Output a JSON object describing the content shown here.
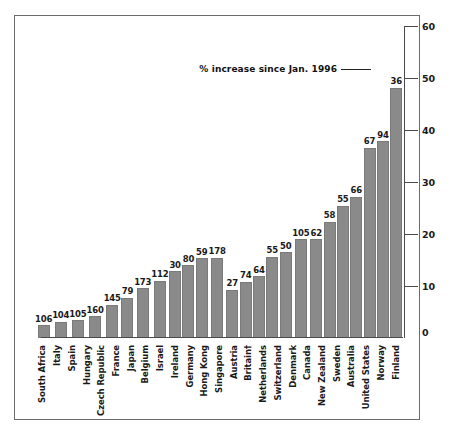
{
  "chart_data": {
    "type": "bar",
    "title": "",
    "subtitle": "",
    "xlabel": "",
    "ylabel": "",
    "ylim": [
      0,
      60
    ],
    "yticks": [
      0,
      10,
      20,
      30,
      40,
      50,
      60
    ],
    "grid": false,
    "legend": null,
    "annotation": {
      "text": "% increase since Jan. 1996",
      "points_to": "36",
      "leader_line": true
    },
    "value_label_note": "Each bar is annotated with a number printed above it.",
    "categories": [
      "South Africa",
      "Italy",
      "Spain",
      "Hungary",
      "Czech Republic",
      "France",
      "Japan",
      "Belgium",
      "Israel",
      "Ireland",
      "Germany",
      "Hong Kong",
      "Singapore",
      "Austria",
      "Britain†",
      "Netherlands",
      "Switzerland",
      "Denmark",
      "Canada",
      "New Zealand",
      "Sweden",
      "Australia",
      "United States",
      "Norway",
      "Finland"
    ],
    "point_labels": [
      "106",
      "104",
      "105",
      "160",
      "145",
      "79",
      "173",
      "112",
      "30",
      "80",
      "59",
      "178",
      "27",
      "74",
      "64",
      "55",
      "50",
      "105",
      "62",
      "58",
      "55",
      "66",
      "67",
      "94",
      "36"
    ],
    "values": [
      2.5,
      3.1,
      3.4,
      4.2,
      6.4,
      7.7,
      9.6,
      11.0,
      12.8,
      14.0,
      15.3,
      15.4,
      9.3,
      10.8,
      11.9,
      15.6,
      16.5,
      19.0,
      19.0,
      22.4,
      25.4,
      27.2,
      36.6,
      37.8,
      48.1
    ],
    "bar_color": "#8a8a8a",
    "frame_color": "#6b6b6b",
    "text_color": "#1a1a1a"
  }
}
